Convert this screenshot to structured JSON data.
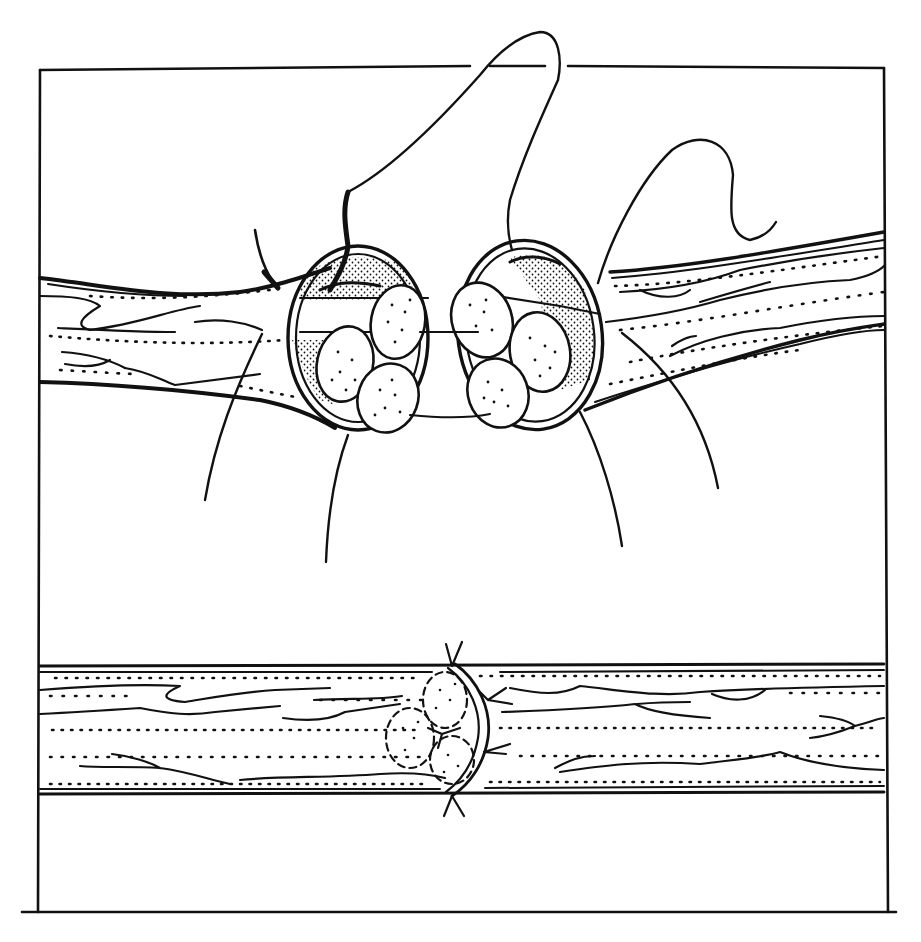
{
  "figure": {
    "title": "",
    "colors": {
      "ink": "#111111",
      "background": "#ffffff"
    },
    "panels": [
      {
        "id": "top",
        "label": "",
        "elements": [
          "proximal-nerve-stump",
          "distal-nerve-stump",
          "epineurium-cuff-left",
          "epineurium-cuff-right",
          "fascicles-left",
          "fascicles-right",
          "suture-loop",
          "suture-needle-curve",
          "traction-threads"
        ]
      },
      {
        "id": "bottom",
        "label": "",
        "elements": [
          "repaired-nerve",
          "coaptation-site",
          "tied-sutures"
        ]
      }
    ],
    "fascicle_count_per_stump": 4,
    "tied_suture_count": 4
  }
}
